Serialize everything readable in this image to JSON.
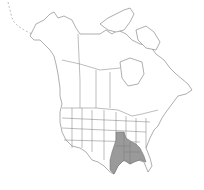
{
  "map": {
    "title": "",
    "region": "North America",
    "style": {
      "background": "#ffffff",
      "outline": "#6a6a6a",
      "range_fill": "#9a9a9a"
    },
    "range_states": [
      "Missouri",
      "Arkansas",
      "Louisiana",
      "Texas (east)",
      "Mississippi",
      "Alabama",
      "Tennessee (west)",
      "Kentucky (west)",
      "Illinois (south)",
      "Georgia (west)"
    ]
  }
}
